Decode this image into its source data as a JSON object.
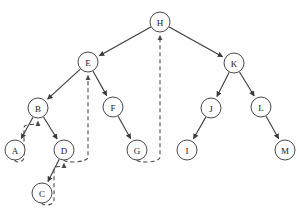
{
  "figure": {
    "background_color": "#fefefe",
    "node_fill_color": "#fdfdfd",
    "node_stroke_color": "#4a4a4a",
    "tree_edge_color": "#3b3b3b",
    "back_edge_color": "#4a4a4a",
    "node_radius": 10,
    "width": 297,
    "height": 211
  },
  "nodes": [
    {
      "id": "H",
      "label": "H",
      "x": 160,
      "y": 22
    },
    {
      "id": "E",
      "label": "E",
      "x": 88,
      "y": 62
    },
    {
      "id": "K",
      "label": "K",
      "x": 234,
      "y": 63
    },
    {
      "id": "B",
      "label": "B",
      "x": 38,
      "y": 108
    },
    {
      "id": "F",
      "label": "F",
      "x": 113,
      "y": 107
    },
    {
      "id": "J",
      "label": "J",
      "x": 211,
      "y": 108
    },
    {
      "id": "L",
      "label": "L",
      "x": 261,
      "y": 107
    },
    {
      "id": "A",
      "label": "A",
      "x": 15,
      "y": 150
    },
    {
      "id": "D",
      "label": "D",
      "x": 64,
      "y": 150
    },
    {
      "id": "G",
      "label": "G",
      "x": 137,
      "y": 150
    },
    {
      "id": "I",
      "label": "I",
      "x": 187,
      "y": 150
    },
    {
      "id": "M",
      "label": "M",
      "x": 285,
      "y": 150
    },
    {
      "id": "C",
      "label": "C",
      "x": 42,
      "y": 193
    }
  ],
  "tree_edges": [
    {
      "from": "H",
      "to": "E",
      "style": "solid",
      "arrow": true
    },
    {
      "from": "H",
      "to": "K",
      "style": "solid",
      "arrow": true
    },
    {
      "from": "E",
      "to": "B",
      "style": "solid",
      "arrow": true
    },
    {
      "from": "E",
      "to": "F",
      "style": "solid",
      "arrow": true
    },
    {
      "from": "B",
      "to": "A",
      "style": "solid",
      "arrow": true
    },
    {
      "from": "B",
      "to": "D",
      "style": "solid",
      "arrow": true
    },
    {
      "from": "F",
      "to": "G",
      "style": "solid",
      "arrow": true
    },
    {
      "from": "K",
      "to": "J",
      "style": "solid",
      "arrow": true
    },
    {
      "from": "K",
      "to": "L",
      "style": "solid",
      "arrow": true
    },
    {
      "from": "J",
      "to": "I",
      "style": "solid",
      "arrow": true
    },
    {
      "from": "L",
      "to": "M",
      "style": "solid",
      "arrow": true
    },
    {
      "from": "D",
      "to": "C",
      "style": "solid",
      "arrow": true
    }
  ],
  "back_edges": [
    {
      "from": "A",
      "to": "B",
      "style": "dashed",
      "arrow": true
    },
    {
      "from": "C",
      "to": "D",
      "style": "dashed",
      "arrow": true
    },
    {
      "from": "D",
      "to": "E",
      "style": "dashed",
      "arrow": true
    },
    {
      "from": "G",
      "to": "H",
      "style": "dashed",
      "arrow": true
    }
  ],
  "legend": {
    "tree_edge_name": "tree edge",
    "back_edge_name": "back edge"
  }
}
